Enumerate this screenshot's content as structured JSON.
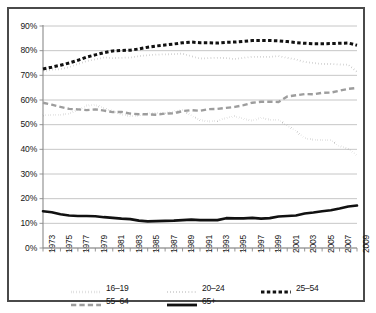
{
  "chart_data": {
    "type": "line",
    "title": "",
    "xlabel": "",
    "ylabel": "",
    "ylim": [
      0,
      90
    ],
    "ytick_labels": [
      "0%",
      "10%",
      "20%",
      "30%",
      "40%",
      "50%",
      "60%",
      "70%",
      "80%",
      "90%"
    ],
    "ytick_values": [
      0,
      10,
      20,
      30,
      40,
      50,
      60,
      70,
      80,
      90
    ],
    "grid": true,
    "legend_position": "bottom",
    "x": [
      1973,
      1974,
      1975,
      1976,
      1977,
      1978,
      1979,
      1980,
      1981,
      1982,
      1983,
      1984,
      1985,
      1986,
      1987,
      1988,
      1989,
      1990,
      1991,
      1992,
      1993,
      1994,
      1995,
      1996,
      1997,
      1998,
      1999,
      2000,
      2001,
      2002,
      2003,
      2004,
      2005,
      2006,
      2007,
      2008,
      2009
    ],
    "xtick_labels": [
      "1973",
      "1975",
      "1977",
      "1979",
      "1981",
      "1983",
      "1985",
      "1987",
      "1989",
      "1991",
      "1993",
      "1995",
      "1997",
      "1999",
      "2001",
      "2003",
      "2005",
      "2007",
      "2009"
    ],
    "series": [
      {
        "name": "16–19",
        "style": "dotted",
        "color": "#111111",
        "width": 2.1,
        "values": [
          53.7,
          54.0,
          54.0,
          54.5,
          56.0,
          57.8,
          57.9,
          56.7,
          55.4,
          54.1,
          53.5,
          53.7,
          54.5,
          54.7,
          54.7,
          55.3,
          55.9,
          53.7,
          51.8,
          51.3,
          51.5,
          52.7,
          53.5,
          52.3,
          51.6,
          52.8,
          52.0,
          52.0,
          49.6,
          47.4,
          44.5,
          43.9,
          43.7,
          43.7,
          41.3,
          40.2,
          37.5
        ]
      },
      {
        "name": "20–24",
        "style": "fine-dotted",
        "color": "#9d9d9d",
        "width": 1.8,
        "values": [
          71.6,
          72.3,
          72.5,
          73.3,
          74.6,
          75.8,
          76.5,
          77.2,
          77.0,
          77.1,
          77.2,
          77.8,
          78.1,
          78.4,
          78.5,
          78.6,
          78.8,
          77.8,
          76.8,
          77.0,
          77.1,
          77.0,
          76.6,
          77.1,
          77.5,
          77.5,
          77.5,
          77.8,
          77.1,
          76.4,
          75.4,
          75.0,
          74.6,
          74.6,
          74.4,
          74.3,
          71.4
        ]
      },
      {
        "name": "25–54",
        "style": "dashed-bold",
        "color": "#111111",
        "width": 3.0,
        "values": [
          72.6,
          73.3,
          74.1,
          75.0,
          76.1,
          77.4,
          78.3,
          79.2,
          79.9,
          80.1,
          80.2,
          80.7,
          81.4,
          81.9,
          82.3,
          82.7,
          83.2,
          83.5,
          83.2,
          83.2,
          83.1,
          83.4,
          83.5,
          83.8,
          84.1,
          84.1,
          84.1,
          84.0,
          83.7,
          83.3,
          83.0,
          82.8,
          82.8,
          82.9,
          83.0,
          83.1,
          82.2
        ]
      },
      {
        "name": "55–64",
        "style": "dashed",
        "color": "#9d9d9d",
        "width": 2.4,
        "values": [
          58.9,
          58.1,
          57.2,
          56.4,
          56.2,
          55.9,
          56.2,
          55.7,
          55.1,
          55.2,
          54.5,
          54.2,
          54.2,
          54.0,
          54.5,
          54.6,
          55.5,
          55.9,
          55.6,
          56.3,
          56.4,
          56.8,
          57.2,
          57.9,
          58.9,
          59.3,
          59.3,
          59.2,
          61.4,
          61.9,
          62.4,
          62.3,
          62.9,
          63.0,
          63.8,
          64.5,
          64.9
        ]
      },
      {
        "name": "65+",
        "style": "solid",
        "color": "#111111",
        "width": 2.6,
        "values": [
          14.9,
          14.5,
          13.7,
          13.2,
          13.0,
          13.0,
          12.9,
          12.5,
          12.2,
          11.9,
          11.7,
          11.1,
          10.8,
          10.9,
          11.0,
          11.1,
          11.3,
          11.5,
          11.3,
          11.3,
          11.3,
          12.1,
          12.0,
          12.0,
          12.2,
          11.9,
          12.1,
          12.8,
          13.0,
          13.2,
          14.0,
          14.4,
          14.9,
          15.3,
          16.0,
          16.8,
          17.2
        ]
      }
    ]
  },
  "legend": {
    "rows": [
      [
        {
          "label": "16–19",
          "style": "dotted",
          "color": "#111111"
        },
        {
          "label": "20–24",
          "style": "fine-dotted",
          "color": "#9d9d9d"
        },
        {
          "label": "25–54",
          "style": "dashed-bold",
          "color": "#111111"
        }
      ],
      [
        {
          "label": "55–64",
          "style": "dashed",
          "color": "#9d9d9d"
        },
        {
          "label": "65+",
          "style": "solid",
          "color": "#111111"
        }
      ]
    ]
  },
  "style": {
    "grid_color": "#b8b8b8",
    "axis_color": "#8a8a8a",
    "frame_color": "#4a4a4a",
    "text_color": "#161616",
    "background": "#ffffff"
  }
}
